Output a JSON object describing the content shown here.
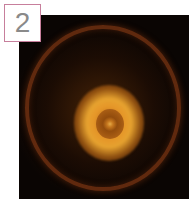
{
  "panel": {
    "label": "2",
    "label_border_color": "#c77f9c",
    "label_text_color": "#8a8a8a"
  },
  "image": {
    "description": "dark square photo of glowing orange ring-shaped light pattern with a faint outer circular halo",
    "background_color": "#0a0503",
    "glow_color": "#e89a30",
    "ring_color": "#8c3c14"
  }
}
